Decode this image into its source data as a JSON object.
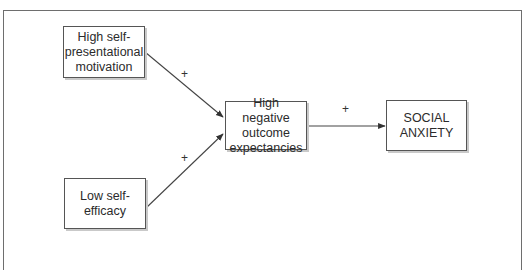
{
  "caption_fragment": "",
  "diagram": {
    "type": "path-model",
    "nodes": [
      {
        "id": "self_presentational",
        "label": "High self-\npresentational\nmotivation"
      },
      {
        "id": "self_efficacy",
        "label": "Low self-\nefficacy"
      },
      {
        "id": "outcome_expectancies",
        "label": "High negative\noutcome\nexpectancies"
      },
      {
        "id": "social_anxiety",
        "label": "SOCIAL\nANXIETY"
      }
    ],
    "edges": [
      {
        "from": "self_presentational",
        "to": "outcome_expectancies",
        "label": "+"
      },
      {
        "from": "self_efficacy",
        "to": "outcome_expectancies",
        "label": "+"
      },
      {
        "from": "outcome_expectancies",
        "to": "social_anxiety",
        "label": "+"
      }
    ]
  },
  "colors": {
    "line": "#444444",
    "box_border": "#555555",
    "shadow": "#c9c9c9"
  }
}
